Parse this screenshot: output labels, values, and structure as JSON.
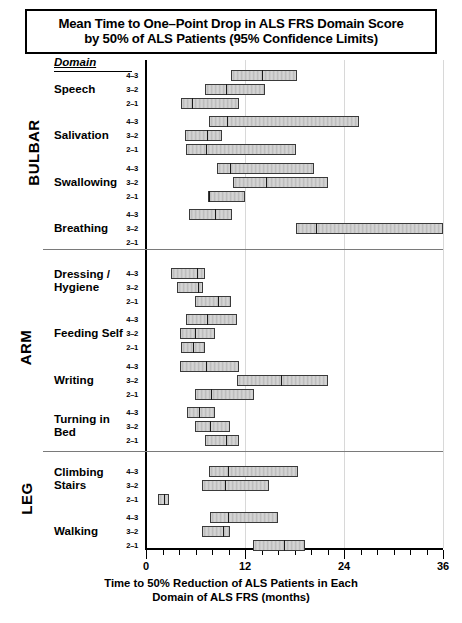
{
  "title": {
    "line1": "Mean Time to One–Point Drop in ALS FRS Domain Score",
    "line2": "by 50% of ALS Patients (95% Confidence Limits)"
  },
  "domain_header": "Domain",
  "xaxis_caption": {
    "line1": "Time to 50% Reduction of ALS Patients in Each",
    "line2": "Domain of ALS FRS (months)"
  },
  "groups": [
    {
      "label": "BULBAR"
    },
    {
      "label": "ARM"
    },
    {
      "label": "LEG"
    }
  ],
  "domains": [
    {
      "name_line1": "Speech",
      "name_line2": ""
    },
    {
      "name_line1": "Salivation",
      "name_line2": ""
    },
    {
      "name_line1": "Swallowing",
      "name_line2": ""
    },
    {
      "name_line1": "Breathing",
      "name_line2": ""
    },
    {
      "name_line1": "Dressing /",
      "name_line2": "Hygiene"
    },
    {
      "name_line1": "Feeding Self",
      "name_line2": ""
    },
    {
      "name_line1": "Writing",
      "name_line2": ""
    },
    {
      "name_line1": "Turning in",
      "name_line2": "Bed"
    },
    {
      "name_line1": "Climbing",
      "name_line2": "Stairs"
    },
    {
      "name_line1": "Walking",
      "name_line2": ""
    }
  ],
  "transition_labels": [
    "4–3",
    "3–2",
    "2–1"
  ],
  "tick_labels": [
    "0",
    "12",
    "24",
    "36"
  ],
  "chart_data": {
    "type": "bar",
    "orientation": "horizontal",
    "title": "Mean Time to One–Point Drop in ALS FRS Domain Score by 50% of ALS Patients (95% Confidence Limits)",
    "xlabel": "Time to 50% Reduction of ALS Patients in Each Domain of ALS FRS (months)",
    "ylabel": "Domain",
    "xlim": [
      0,
      36
    ],
    "xticks": [
      0,
      12,
      24,
      36
    ],
    "xminor_tick_interval": 2,
    "grid": "vertical-gridlines-at-major-ticks",
    "legend": "none",
    "value_unit": "months",
    "groups": [
      "BULBAR",
      "ARM",
      "LEG"
    ],
    "series": [
      {
        "group": "BULBAR",
        "domain": "Speech",
        "transition": "4–3",
        "lower": 10.3,
        "mean": 13.9,
        "upper": 18.3
      },
      {
        "group": "BULBAR",
        "domain": "Speech",
        "transition": "3–2",
        "lower": 7.2,
        "mean": 9.6,
        "upper": 14.4
      },
      {
        "group": "BULBAR",
        "domain": "Speech",
        "transition": "2–1",
        "lower": 4.2,
        "mean": 5.5,
        "upper": 11.3
      },
      {
        "group": "BULBAR",
        "domain": "Salivation",
        "transition": "4–3",
        "lower": 7.6,
        "mean": 9.7,
        "upper": 25.8
      },
      {
        "group": "BULBAR",
        "domain": "Salivation",
        "transition": "3–2",
        "lower": 4.7,
        "mean": 7.3,
        "upper": 9.2
      },
      {
        "group": "BULBAR",
        "domain": "Salivation",
        "transition": "2–1",
        "lower": 4.8,
        "mean": 7.1,
        "upper": 18.2
      },
      {
        "group": "BULBAR",
        "domain": "Swallowing",
        "transition": "4–3",
        "lower": 8.6,
        "mean": 10.1,
        "upper": 20.4
      },
      {
        "group": "BULBAR",
        "domain": "Swallowing",
        "transition": "3–2",
        "lower": 10.5,
        "mean": 14.4,
        "upper": 22.1
      },
      {
        "group": "BULBAR",
        "domain": "Swallowing",
        "transition": "2–1",
        "lower": 7.5,
        "mean": 7.5,
        "upper": 12.0
      },
      {
        "group": "BULBAR",
        "domain": "Breathing",
        "transition": "4–3",
        "lower": 5.2,
        "mean": 8.2,
        "upper": 10.4
      },
      {
        "group": "BULBAR",
        "domain": "Breathing",
        "transition": "3–2",
        "lower": 18.2,
        "mean": 20.5,
        "upper": 36.0
      },
      {
        "group": "ARM",
        "domain": "Dressing / Hygiene",
        "transition": "4–3",
        "lower": 3.0,
        "mean": 6.1,
        "upper": 7.1
      },
      {
        "group": "ARM",
        "domain": "Dressing / Hygiene",
        "transition": "3–2",
        "lower": 3.8,
        "mean": 6.2,
        "upper": 6.9
      },
      {
        "group": "ARM",
        "domain": "Dressing / Hygiene",
        "transition": "2–1",
        "lower": 5.9,
        "mean": 8.6,
        "upper": 10.3
      },
      {
        "group": "ARM",
        "domain": "Feeding Self",
        "transition": "4–3",
        "lower": 4.8,
        "mean": 7.3,
        "upper": 11.0
      },
      {
        "group": "ARM",
        "domain": "Feeding Self",
        "transition": "3–2",
        "lower": 4.1,
        "mean": 5.8,
        "upper": 8.4
      },
      {
        "group": "ARM",
        "domain": "Feeding Self",
        "transition": "2–1",
        "lower": 4.2,
        "mean": 5.6,
        "upper": 7.2
      },
      {
        "group": "ARM",
        "domain": "Writing",
        "transition": "4–3",
        "lower": 4.1,
        "mean": 7.1,
        "upper": 11.3
      },
      {
        "group": "ARM",
        "domain": "Writing",
        "transition": "3–2",
        "lower": 11.0,
        "mean": 16.2,
        "upper": 22.0
      },
      {
        "group": "ARM",
        "domain": "Writing",
        "transition": "2–1",
        "lower": 5.9,
        "mean": 7.8,
        "upper": 13.1
      },
      {
        "group": "ARM",
        "domain": "Turning in Bed",
        "transition": "4–3",
        "lower": 5.0,
        "mean": 6.3,
        "upper": 8.4
      },
      {
        "group": "ARM",
        "domain": "Turning in Bed",
        "transition": "3–2",
        "lower": 5.9,
        "mean": 7.6,
        "upper": 10.2
      },
      {
        "group": "ARM",
        "domain": "Turning in Bed",
        "transition": "2–1",
        "lower": 7.2,
        "mean": 9.6,
        "upper": 11.3
      },
      {
        "group": "LEG",
        "domain": "Climbing Stairs",
        "transition": "4–3",
        "lower": 7.6,
        "mean": 9.8,
        "upper": 18.4
      },
      {
        "group": "LEG",
        "domain": "Climbing Stairs",
        "transition": "3–2",
        "lower": 6.8,
        "mean": 9.5,
        "upper": 14.9
      },
      {
        "group": "LEG",
        "domain": "Climbing Stairs",
        "transition": "2–1",
        "lower": 1.4,
        "mean": 2.1,
        "upper": 2.8
      },
      {
        "group": "LEG",
        "domain": "Walking",
        "transition": "4–3",
        "lower": 7.7,
        "mean": 9.8,
        "upper": 16.0
      },
      {
        "group": "LEG",
        "domain": "Walking",
        "transition": "3–2",
        "lower": 6.8,
        "mean": 9.2,
        "upper": 10.2
      },
      {
        "group": "LEG",
        "domain": "Walking",
        "transition": "2–1",
        "lower": 13.0,
        "mean": 16.6,
        "upper": 19.3
      }
    ]
  }
}
